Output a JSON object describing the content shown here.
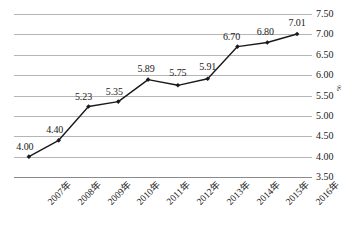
{
  "chart_data": {
    "type": "line",
    "title": "",
    "xlabel": "",
    "ylabel": "%",
    "categories": [
      "2007年",
      "2008年",
      "2009年",
      "2010年",
      "2011年",
      "2012年",
      "2013年",
      "2014年",
      "2015年",
      "2016年"
    ],
    "values": [
      4.0,
      4.4,
      5.23,
      5.35,
      5.89,
      5.75,
      5.91,
      6.7,
      6.8,
      7.01
    ],
    "point_labels": [
      "4.00",
      "4.40",
      "5.23",
      "5.35",
      "5.89",
      "5.75",
      "5.91",
      "6.70",
      "6.80",
      "7.01"
    ],
    "ylim": [
      3.5,
      7.5
    ],
    "ytick_step": 0.5,
    "ytick_labels": [
      "7.50",
      "7.00",
      "6.50",
      "6.00",
      "5.50",
      "5.00",
      "4.50",
      "4.00",
      "3.50"
    ],
    "ytick_values": [
      7.5,
      7.0,
      6.5,
      6.0,
      5.5,
      5.0,
      4.5,
      4.0,
      3.5
    ],
    "y_axis_position": "right",
    "grid": true,
    "grid_orientation": "horizontal",
    "legend": false,
    "legend_position": "none",
    "marker": "diamond",
    "show_data_labels": true,
    "colors": {
      "line": "#1a1a1a",
      "marker": "#1a1a1a",
      "gridline": "#b5b5b5",
      "axis": "#8a8a8a",
      "text": "#1a1a1a",
      "background": "#ffffff"
    }
  }
}
